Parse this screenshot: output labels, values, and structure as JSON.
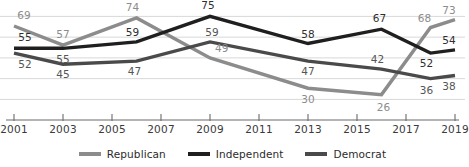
{
  "chart_data": {
    "type": "line",
    "title": "",
    "subtitle": "",
    "xlabel": "",
    "ylabel": "",
    "x": [
      2001,
      2003,
      2006,
      2009,
      2013,
      2016,
      2018,
      2019
    ],
    "tick_labels": [
      "2001",
      "2003",
      "2005",
      "2007",
      "2009",
      "2011",
      "2013",
      "2015",
      "2017",
      "2019"
    ],
    "tick_years": [
      2001,
      2003,
      2005,
      2007,
      2009,
      2011,
      2013,
      2015,
      2017,
      2019
    ],
    "xlim": [
      2001,
      2019
    ],
    "ylim": [
      22,
      79
    ],
    "grid": true,
    "grid_values": [
      75,
      62,
      49,
      36,
      23
    ],
    "legend_position": "bottom-center",
    "series": [
      {
        "name": "Republican",
        "color": "#8c8c8c",
        "x": [
          2001,
          2003,
          2006,
          2009,
          2013,
          2016,
          2018,
          2019
        ],
        "values": [
          69,
          57,
          74,
          49,
          30,
          26,
          68,
          73
        ],
        "labels": [
          "69",
          "57",
          "74",
          "49",
          "30",
          "26",
          "68",
          "73"
        ]
      },
      {
        "name": "Independent",
        "color": "#1f1f1f",
        "x": [
          2001,
          2003,
          2006,
          2009,
          2013,
          2016,
          2018,
          2019
        ],
        "values": [
          55,
          55,
          59,
          75,
          58,
          67,
          52,
          54
        ],
        "labels": [
          "55",
          "55",
          "59",
          "75",
          "58",
          "67",
          "52",
          "54"
        ]
      },
      {
        "name": "Democrat",
        "color": "#4a4a4a",
        "x": [
          2001,
          2003,
          2006,
          2009,
          2013,
          2016,
          2018,
          2019
        ],
        "values": [
          52,
          45,
          47,
          59,
          47,
          42,
          36,
          38
        ],
        "labels": [
          "52",
          "45",
          "47",
          "59",
          "47",
          "42",
          "36",
          "38"
        ]
      }
    ],
    "point_labels": [
      {
        "series": "Republican",
        "text": "69",
        "x": 2001,
        "y": 69,
        "dx": 10,
        "dy": -11
      },
      {
        "series": "Republican",
        "text": "57",
        "x": 2003,
        "y": 57,
        "dx": 0,
        "dy": -11
      },
      {
        "series": "Republican",
        "text": "74",
        "x": 2006,
        "y": 74,
        "dx": -4,
        "dy": -11
      },
      {
        "series": "Republican",
        "text": "49",
        "x": 2009.4,
        "y": 49,
        "dx": 2,
        "dy": -10
      },
      {
        "series": "Republican",
        "text": "30",
        "x": 2013,
        "y": 30,
        "dx": 0,
        "dy": 11
      },
      {
        "series": "Republican",
        "text": "26",
        "x": 2016,
        "y": 26,
        "dx": 2,
        "dy": 12
      },
      {
        "series": "Republican",
        "text": "68",
        "x": 2018,
        "y": 68,
        "dx": -6,
        "dy": -10
      },
      {
        "series": "Republican",
        "text": "73",
        "x": 2019,
        "y": 73,
        "dx": -6,
        "dy": -10
      },
      {
        "series": "Independent",
        "text": "55",
        "x": 2001,
        "y": 55,
        "dx": 11,
        "dy": -11
      },
      {
        "series": "Independent",
        "text": "57",
        "x": 2003,
        "y": 57,
        "dx": 0,
        "dy": 0,
        "hidden": true
      },
      {
        "series": "Independent",
        "text": "59",
        "x": 2006,
        "y": 59,
        "dx": -4,
        "dy": -10
      },
      {
        "series": "Independent",
        "text": "75",
        "x": 2009,
        "y": 75,
        "dx": -2,
        "dy": -11
      },
      {
        "series": "Independent",
        "text": "58",
        "x": 2013,
        "y": 58,
        "dx": 0,
        "dy": -10
      },
      {
        "series": "Independent",
        "text": "67",
        "x": 2016,
        "y": 67,
        "dx": -2,
        "dy": -11
      },
      {
        "series": "Independent",
        "text": "52",
        "x": 2018,
        "y": 52,
        "dx": -4,
        "dy": 10
      },
      {
        "series": "Independent",
        "text": "54",
        "x": 2019,
        "y": 54,
        "dx": -6,
        "dy": -10
      },
      {
        "series": "Democrat",
        "text": "52",
        "x": 2001,
        "y": 52,
        "dx": 11,
        "dy": 11
      },
      {
        "series": "Democrat",
        "text": "55",
        "x": 2003,
        "y": 55,
        "dx": 0,
        "dy": 11
      },
      {
        "series": "Democrat",
        "text": "45",
        "x": 2003,
        "y": 45,
        "dx": 0,
        "dy": 10
      },
      {
        "series": "Democrat",
        "text": "47",
        "x": 2006,
        "y": 47,
        "dx": -2,
        "dy": 10
      },
      {
        "series": "Democrat",
        "text": "59",
        "x": 2009,
        "y": 59,
        "dx": 2,
        "dy": -10
      },
      {
        "series": "Democrat",
        "text": "47",
        "x": 2013,
        "y": 47,
        "dx": 0,
        "dy": 10
      },
      {
        "series": "Democrat",
        "text": "42",
        "x": 2016,
        "y": 42,
        "dx": -4,
        "dy": -10
      },
      {
        "series": "Democrat",
        "text": "36",
        "x": 2018,
        "y": 36,
        "dx": -4,
        "dy": 11
      },
      {
        "series": "Democrat",
        "text": "38",
        "x": 2019,
        "y": 38,
        "dx": -6,
        "dy": 11
      }
    ]
  },
  "legend": {
    "items": [
      {
        "label": "Republican",
        "color": "#8c8c8c"
      },
      {
        "label": "Independent",
        "color": "#1f1f1f"
      },
      {
        "label": "Democrat",
        "color": "#4a4a4a"
      }
    ]
  },
  "axis": {
    "line_color": "#6b6b6b",
    "grid_color": "#d8d8d8"
  }
}
